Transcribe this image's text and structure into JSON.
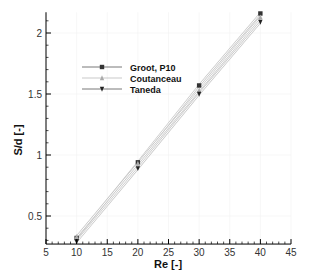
{
  "chart_data": {
    "type": "line",
    "title": "",
    "xlabel": "Re [-]",
    "ylabel": "S/d [-]",
    "xlim": [
      5,
      45
    ],
    "ylim": [
      0.27,
      2.17
    ],
    "xticks": [
      5,
      10,
      15,
      20,
      25,
      30,
      35,
      40,
      45
    ],
    "yticks": [
      0.5,
      1,
      1.5,
      2
    ],
    "xtick_labels": [
      "5",
      "10",
      "15",
      "20",
      "25",
      "30",
      "35",
      "40",
      "45"
    ],
    "ytick_labels": [
      "0.5",
      "1",
      "1.5",
      "2"
    ],
    "grid": true,
    "legend_position": "upper-left (inside)",
    "x": [
      10,
      20,
      30,
      40
    ],
    "series": [
      {
        "name": "Groot, P10",
        "marker": "square",
        "color": "#333333",
        "values": [
          0.32,
          0.94,
          1.57,
          2.16
        ]
      },
      {
        "name": "Coutanceau",
        "marker": "triangle-up",
        "color": "#aaaaaa",
        "values": [
          0.33,
          0.93,
          1.53,
          2.13
        ]
      },
      {
        "name": "Taneda",
        "marker": "triangle-down",
        "color": "#222222",
        "values": [
          0.29,
          0.89,
          1.5,
          2.09
        ]
      }
    ]
  }
}
